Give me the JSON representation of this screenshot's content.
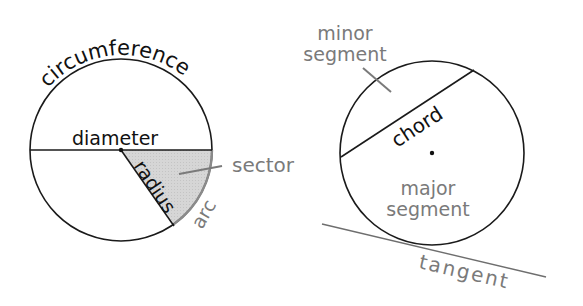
{
  "diagram": {
    "left": {
      "labels": {
        "circumference": "circumference",
        "diameter": "diameter",
        "radius": "radius",
        "sector": "sector",
        "arc": "arc"
      }
    },
    "right": {
      "labels": {
        "minor_segment_line1": "minor",
        "minor_segment_line2": "segment",
        "chord": "chord",
        "major_segment_line1": "major",
        "major_segment_line2": "segment",
        "tangent": "tangent"
      }
    },
    "colors": {
      "outline": "#1a1a1a",
      "gray_label": "#7a7a7a",
      "sector_fill": "#d9d9d9",
      "arc_stroke": "#8a8a8a",
      "tangent_stroke": "#6e6e6e"
    }
  }
}
